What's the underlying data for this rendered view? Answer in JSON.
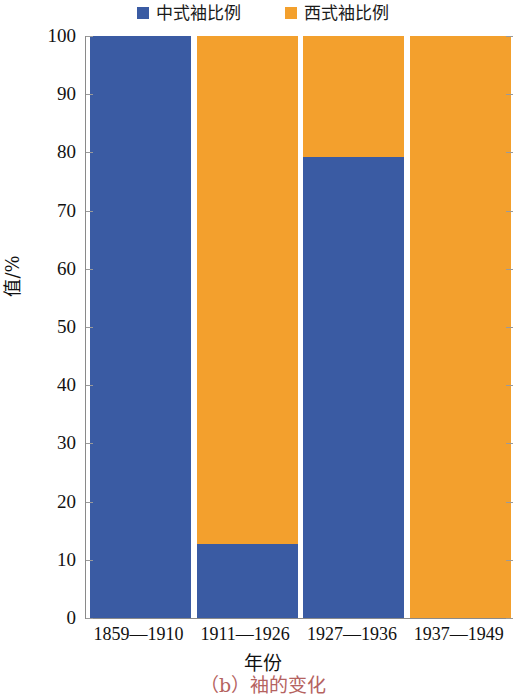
{
  "chart_data": {
    "type": "bar",
    "stacked": true,
    "title": "",
    "subtitle": "",
    "categories": [
      "1859—1910",
      "1911—1926",
      "1927—1936",
      "1937—1949"
    ],
    "series": [
      {
        "name": "中式袖比例",
        "color": "#3a5ba3",
        "values": [
          100,
          12.7,
          79.2,
          0
        ]
      },
      {
        "name": "西式袖比例",
        "color": "#f3a02d",
        "values": [
          0,
          87.3,
          20.8,
          100
        ]
      }
    ],
    "xlabel": "年份",
    "ylabel": "值/%",
    "ylim": [
      0,
      100
    ],
    "yticks": [
      0,
      10,
      20,
      30,
      40,
      50,
      60,
      70,
      80,
      90,
      100
    ],
    "ytick_labels": [
      "0",
      "10",
      "20",
      "30",
      "40",
      "50",
      "60",
      "70",
      "80",
      "90",
      "100"
    ],
    "grid": false,
    "legend_position": "top",
    "caption": "（b）袖的变化",
    "caption_color": "#b5635f",
    "axis_color": "#8a8a8a"
  }
}
